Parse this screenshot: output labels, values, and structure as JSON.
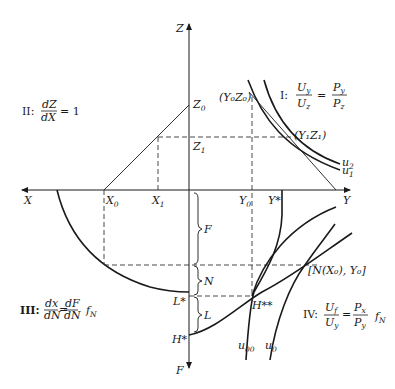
{
  "axes": {
    "z_label": "Z",
    "x_label": "X",
    "y_label": "Y",
    "f_label": "F"
  },
  "points": {
    "z0": "Z",
    "z0_sub": "0",
    "z1": "Z",
    "z1_sub": "1",
    "x0": "X",
    "x0_sub": "0",
    "x1": "X",
    "x1_sub": "1",
    "y0": "Y",
    "y0_sub": "0",
    "y_star": "Y*",
    "y0z0": "(Y₀Z₀)",
    "y1z1": "(Y₁Z₁)",
    "l_star": "L*",
    "h_star": "H*",
    "h_star_star": "H**",
    "n_x0_y0": "[N(X₀), Y₀]"
  },
  "braces": {
    "f": "F",
    "n": "N",
    "l": "L"
  },
  "curves": {
    "u1": "u",
    "u1_sub": "1",
    "u2": "u",
    "u2_sub": "2",
    "u00": "u",
    "u00_sub": "00",
    "u0": "u",
    "u0_sub": "0"
  },
  "quadrants": {
    "I": {
      "numeral": "I:",
      "lhs_num": "U",
      "lhs_num_sub": "y",
      "lhs_den": "U",
      "lhs_den_sub": "z",
      "eq": "=",
      "rhs_num": "P",
      "rhs_num_sub": "y",
      "rhs_den": "P",
      "rhs_den_sub": "z"
    },
    "II": {
      "numeral": "II:",
      "num": "dZ",
      "den": "dX",
      "rhs": "= 1"
    },
    "III": {
      "numeral": "III:",
      "lhs_num": "dx",
      "lhs_den": "dN",
      "eq": "=",
      "rhs_num": "dF",
      "rhs_den": "dN",
      "f": "f",
      "f_sub": "N"
    },
    "IV": {
      "numeral": "IV:",
      "lhs_num": "U",
      "lhs_num_sub": "f",
      "lhs_den": "U",
      "lhs_den_sub": "y",
      "eq": "=",
      "rhs_num": "P",
      "rhs_num_sub": "x",
      "rhs_den": "P",
      "rhs_den_sub": "y",
      "f": "f",
      "f_sub": "N"
    }
  }
}
